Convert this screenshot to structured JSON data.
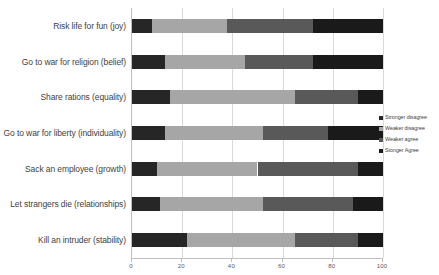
{
  "chart_data": {
    "type": "bar",
    "orientation": "horizontal",
    "stacked": true,
    "title": "",
    "xlabel": "",
    "ylabel": "",
    "xlim": [
      0,
      100
    ],
    "xticks": [
      0,
      20,
      40,
      60,
      80,
      100
    ],
    "grid": true,
    "legend_position": "right",
    "categories": [
      "Risk life for fun (joy)",
      "Go to war for religion (belief)",
      "Share rations (equality)",
      "Go to war for liberty (individuality)",
      "Sack an employee (growth)",
      "Let strangers die (relationships)",
      "Kill an intruder (stability)"
    ],
    "series": [
      {
        "name": "Stronger disagree",
        "color": "#262626",
        "values": [
          8,
          13,
          15,
          13,
          10,
          11,
          22
        ]
      },
      {
        "name": "Weaker disagree",
        "color": "#a6a6a6",
        "values": [
          30,
          32,
          50,
          39,
          40,
          41,
          43
        ]
      },
      {
        "name": "Weaker agree",
        "color": "#595959",
        "values": [
          34,
          27,
          25,
          26,
          40,
          36,
          25
        ]
      },
      {
        "name": "Stonger Agree",
        "color": "#1a1a1a",
        "values": [
          28,
          28,
          10,
          22,
          10,
          12,
          10
        ]
      }
    ]
  },
  "axis": {
    "tick_labels": [
      "0",
      "20",
      "40",
      "60",
      "80",
      "100"
    ]
  },
  "legend": {
    "entries": [
      {
        "label": "Stronger disagree",
        "color": "#262626"
      },
      {
        "label": "Weaker disagree",
        "color": "#a6a6a6"
      },
      {
        "label": "Weaker agree",
        "color": "#595959"
      },
      {
        "label": "Stonger Agree",
        "color": "#1a1a1a"
      }
    ]
  }
}
